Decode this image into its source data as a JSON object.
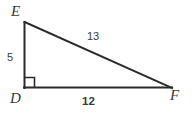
{
  "figure": {
    "kind": "right-triangle-diagram",
    "background_color": "#ffffff",
    "stroke_color": "#2b2b2b",
    "text_color": "#3a3a3a",
    "vertices": {
      "e": {
        "label": "E",
        "x": 24,
        "y": 22
      },
      "d": {
        "label": "D",
        "x": 24,
        "y": 88
      },
      "f": {
        "label": "F",
        "x": 172,
        "y": 88
      }
    },
    "sides": {
      "de": {
        "label": "5",
        "bold": false
      },
      "ef": {
        "label": "13",
        "bold": false
      },
      "df": {
        "label": "12",
        "bold": true
      }
    },
    "right_angle": {
      "at_vertex": "D",
      "marker": "right-angle-square",
      "size": 10
    }
  }
}
